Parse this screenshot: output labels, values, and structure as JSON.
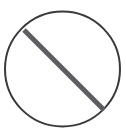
{
  "canvas": {
    "width": 126,
    "height": 137,
    "background_color": "#ffffff"
  },
  "symbol": {
    "name": "prohibition-sign",
    "label": "No / Prohibited",
    "description": "Circle with diagonal slash from upper-left to lower-right",
    "circle": {
      "center_x": 62.5,
      "center_y": 69,
      "radius": 57.5,
      "stroke_color": "#3a3a3c",
      "stroke_width": 2,
      "fill": "none"
    },
    "slash": {
      "x1": 24,
      "y1": 30,
      "x2": 104,
      "y2": 110,
      "stroke_color": "#5e5e62",
      "stroke_width": 5,
      "linecap": "butt",
      "angle_degrees": 45
    }
  }
}
